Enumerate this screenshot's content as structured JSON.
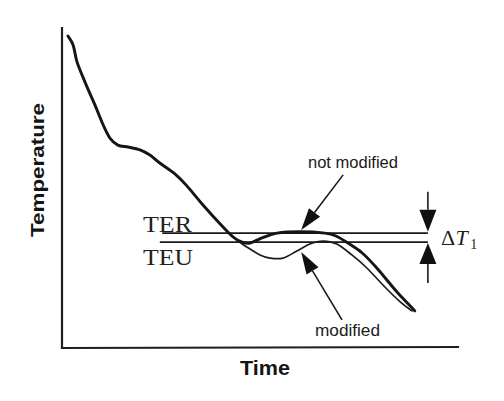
{
  "chart_data": {
    "type": "line",
    "title": "",
    "xlabel": "Time",
    "ylabel": "Temperature",
    "xlim": [
      0,
      100
    ],
    "ylim": [
      0,
      100
    ],
    "units": "arbitrary (schematic plot, no tick labels)",
    "grid": false,
    "legend": "none (arrow callout labels)",
    "series": [
      {
        "name": "not modified",
        "line_weight": "thick",
        "points": [
          [
            1.5,
            97.5
          ],
          [
            2.8,
            94.7
          ],
          [
            3.8,
            89.4
          ],
          [
            5.8,
            83.1
          ],
          [
            8.3,
            76.0
          ],
          [
            10.4,
            69.7
          ],
          [
            12.1,
            65.6
          ],
          [
            14.1,
            63.4
          ],
          [
            16.7,
            62.8
          ],
          [
            19.7,
            61.9
          ],
          [
            22.2,
            60.3
          ],
          [
            24.7,
            57.8
          ],
          [
            28.5,
            54.4
          ],
          [
            31.6,
            50.6
          ],
          [
            35.6,
            44.7
          ],
          [
            39.9,
            38.8
          ],
          [
            43.2,
            34.7
          ],
          [
            45.5,
            33.1
          ],
          [
            47.5,
            32.8
          ],
          [
            50.5,
            34.4
          ],
          [
            54.3,
            35.9
          ],
          [
            60.1,
            36.3
          ],
          [
            66.4,
            35.9
          ],
          [
            69.2,
            35.0
          ],
          [
            72.2,
            32.8
          ],
          [
            75.8,
            29.7
          ],
          [
            79.5,
            25.0
          ],
          [
            84.6,
            17.5
          ],
          [
            89.1,
            11.6
          ]
        ]
      },
      {
        "name": "modified",
        "line_weight": "thin",
        "points": [
          [
            1.5,
            97.5
          ],
          [
            2.8,
            94.7
          ],
          [
            3.8,
            89.4
          ],
          [
            5.8,
            83.1
          ],
          [
            8.3,
            76.0
          ],
          [
            10.4,
            69.7
          ],
          [
            12.1,
            65.6
          ],
          [
            14.1,
            63.4
          ],
          [
            16.7,
            62.8
          ],
          [
            19.7,
            61.9
          ],
          [
            22.2,
            60.3
          ],
          [
            24.7,
            57.8
          ],
          [
            28.5,
            54.4
          ],
          [
            31.6,
            50.6
          ],
          [
            35.6,
            44.7
          ],
          [
            39.9,
            38.8
          ],
          [
            43.2,
            34.7
          ],
          [
            45.5,
            32.5
          ],
          [
            47.5,
            30.9
          ],
          [
            50.0,
            29.1
          ],
          [
            52.5,
            28.1
          ],
          [
            55.8,
            28.1
          ],
          [
            59.3,
            30.3
          ],
          [
            62.6,
            32.5
          ],
          [
            65.9,
            33.4
          ],
          [
            69.4,
            32.5
          ],
          [
            73.2,
            29.1
          ],
          [
            77.0,
            25.0
          ],
          [
            80.8,
            20.0
          ],
          [
            85.4,
            14.4
          ],
          [
            88.4,
            11.6
          ]
        ]
      }
    ],
    "reference_lines": [
      {
        "label": "TER",
        "y": 35.9,
        "x_range": [
          25.3,
          92.4
        ]
      },
      {
        "label": "TEU",
        "y": 33.1,
        "x_range": [
          24.7,
          92.4
        ]
      }
    ],
    "annotations": [
      {
        "text": "not modified",
        "target_series": "not modified",
        "arrow_from": [
          71.0,
          54.1
        ],
        "arrow_to": [
          60.4,
          36.9
        ]
      },
      {
        "text": "modified",
        "target_series": "modified",
        "arrow_from": [
          70.7,
          8.8
        ],
        "arrow_to": [
          60.4,
          30.0
        ]
      },
      {
        "text": "ΔT1",
        "symbol": "Δ",
        "variable": "T",
        "subscript": "1",
        "type": "dimension",
        "between": [
          "TER",
          "TEU"
        ],
        "arrows": [
          {
            "arrow_from": [
              92.4,
              48.8
            ],
            "arrow_to": [
              92.4,
              36.3
            ]
          },
          {
            "arrow_from": [
              92.4,
              20.3
            ],
            "arrow_to": [
              92.4,
              32.8
            ]
          }
        ]
      }
    ]
  }
}
